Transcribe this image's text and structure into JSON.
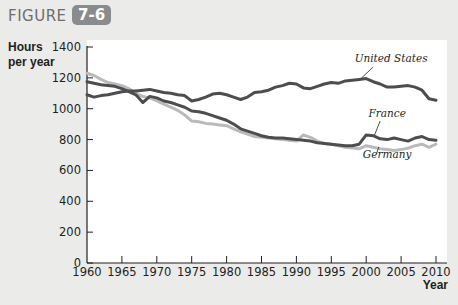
{
  "figure": {
    "label": "FIGURE",
    "number": "7-6"
  },
  "axes": {
    "y_title_line1": "Hours",
    "y_title_line2": "per year",
    "x_title": "Year"
  },
  "colors": {
    "background": "#ebebea",
    "plot_background": "#ffffff",
    "badge": "#8a8b8c",
    "united_states": "#4d4d4f",
    "france": "#4d4d4f",
    "germany": "#b9babb",
    "axis": "#231f20"
  },
  "chart_data": {
    "type": "line",
    "xlabel": "Year",
    "ylabel": "Hours per year",
    "xlim": [
      1960,
      2011
    ],
    "ylim": [
      0,
      1400
    ],
    "x_ticks": [
      1960,
      1965,
      1970,
      1975,
      1980,
      1985,
      1990,
      1995,
      2000,
      2005,
      2010
    ],
    "y_ticks": [
      0,
      200,
      400,
      600,
      800,
      1000,
      1200,
      1400
    ],
    "grid": false,
    "legend": "inline labels",
    "series": [
      {
        "name": "United States",
        "x": [
          1960,
          1961,
          1962,
          1963,
          1964,
          1965,
          1966,
          1967,
          1968,
          1969,
          1970,
          1971,
          1972,
          1973,
          1974,
          1975,
          1976,
          1977,
          1978,
          1979,
          1980,
          1981,
          1982,
          1983,
          1984,
          1985,
          1986,
          1987,
          1988,
          1989,
          1990,
          1991,
          1992,
          1993,
          1994,
          1995,
          1996,
          1997,
          1998,
          1999,
          2000,
          2001,
          2002,
          2003,
          2004,
          2005,
          2006,
          2007,
          2008,
          2009,
          2010
        ],
        "values": [
          1090,
          1075,
          1085,
          1090,
          1100,
          1110,
          1115,
          1115,
          1120,
          1125,
          1115,
          1105,
          1100,
          1090,
          1085,
          1050,
          1060,
          1075,
          1095,
          1100,
          1090,
          1075,
          1060,
          1075,
          1105,
          1110,
          1120,
          1140,
          1150,
          1165,
          1160,
          1135,
          1130,
          1145,
          1160,
          1170,
          1165,
          1180,
          1185,
          1190,
          1195,
          1175,
          1160,
          1140,
          1140,
          1145,
          1150,
          1140,
          1120,
          1065,
          1055
        ]
      },
      {
        "name": "France",
        "x": [
          1960,
          1961,
          1962,
          1963,
          1964,
          1965,
          1966,
          1967,
          1968,
          1969,
          1970,
          1971,
          1972,
          1973,
          1974,
          1975,
          1976,
          1977,
          1978,
          1979,
          1980,
          1981,
          1982,
          1983,
          1984,
          1985,
          1986,
          1987,
          1988,
          1989,
          1990,
          1991,
          1992,
          1993,
          1994,
          1995,
          1996,
          1997,
          1998,
          1999,
          2000,
          2001,
          2002,
          2003,
          2004,
          2005,
          2006,
          2007,
          2008,
          2009,
          2010
        ],
        "values": [
          1175,
          1165,
          1155,
          1150,
          1145,
          1130,
          1110,
          1090,
          1040,
          1080,
          1070,
          1050,
          1040,
          1025,
          1010,
          985,
          980,
          970,
          955,
          940,
          925,
          900,
          870,
          855,
          840,
          825,
          815,
          810,
          810,
          805,
          800,
          795,
          790,
          780,
          775,
          770,
          765,
          760,
          760,
          770,
          830,
          825,
          805,
          800,
          810,
          800,
          790,
          810,
          820,
          800,
          795
        ]
      },
      {
        "name": "Germany",
        "x": [
          1960,
          1961,
          1962,
          1963,
          1964,
          1965,
          1966,
          1967,
          1968,
          1969,
          1970,
          1971,
          1972,
          1973,
          1974,
          1975,
          1976,
          1977,
          1978,
          1979,
          1980,
          1981,
          1982,
          1983,
          1984,
          1985,
          1986,
          1987,
          1988,
          1989,
          1990,
          1991,
          1992,
          1993,
          1994,
          1995,
          1996,
          1997,
          1998,
          1999,
          2000,
          2001,
          2002,
          2003,
          2004,
          2005,
          2006,
          2007,
          2008,
          2009,
          2010
        ],
        "values": [
          1230,
          1215,
          1190,
          1170,
          1160,
          1150,
          1130,
          1100,
          1080,
          1070,
          1050,
          1030,
          1010,
          990,
          960,
          920,
          915,
          905,
          900,
          895,
          890,
          870,
          850,
          835,
          820,
          815,
          810,
          805,
          800,
          795,
          790,
          830,
          815,
          790,
          775,
          770,
          760,
          750,
          745,
          740,
          760,
          750,
          740,
          735,
          730,
          735,
          745,
          760,
          770,
          750,
          770
        ]
      }
    ],
    "annotations": [
      {
        "text": "United States",
        "x": 2003,
        "y": 1290
      },
      {
        "text": "France",
        "x": 2003,
        "y": 940
      },
      {
        "text": "Germany",
        "x": 2003,
        "y": 670
      }
    ]
  }
}
